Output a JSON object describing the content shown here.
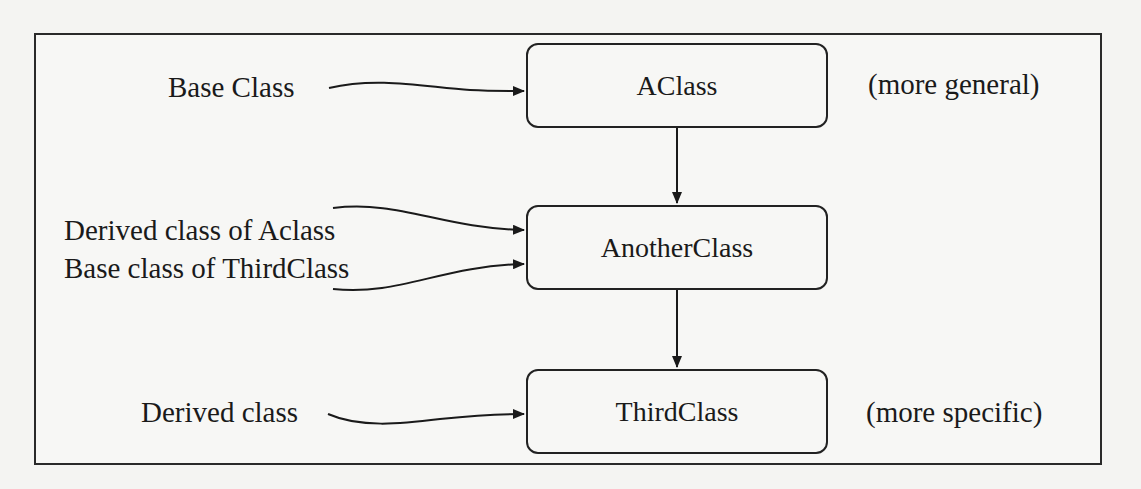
{
  "diagram": {
    "type": "class-hierarchy",
    "classes": [
      {
        "name": "AClass",
        "note": "(more general)"
      },
      {
        "name": "AnotherClass"
      },
      {
        "name": "ThirdClass",
        "note": "(more specific)"
      }
    ],
    "annotations": [
      {
        "text": "Base Class",
        "points_to": "AClass"
      },
      {
        "text": "Derived class of Aclass",
        "points_to": "AnotherClass"
      },
      {
        "text": "Base class of ThirdClass",
        "points_to": "AnotherClass"
      },
      {
        "text": "Derived class",
        "points_to": "ThirdClass"
      }
    ],
    "edges": [
      {
        "from": "AClass",
        "to": "AnotherClass"
      },
      {
        "from": "AnotherClass",
        "to": "ThirdClass"
      }
    ]
  }
}
